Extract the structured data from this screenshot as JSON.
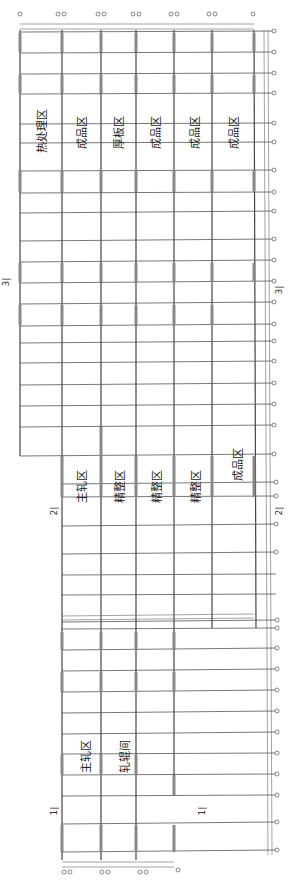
{
  "drawing": {
    "orientation": "rotated-90",
    "upper_zones": [
      "热处理区",
      "成品区",
      "厚板区",
      "成品区",
      "成品区",
      "成品区"
    ],
    "middle_zones": [
      "主轧区",
      "精整区",
      "精整区",
      "精整区",
      "成品区"
    ],
    "lower_zones": [
      "主轧区",
      "轧辊间"
    ],
    "section_marks": {
      "s3_left": "3|",
      "s3_right": "3|",
      "s2_left": "2|",
      "s2_right": "2|",
      "s1_left": "1|",
      "s1_right": "1|"
    }
  }
}
